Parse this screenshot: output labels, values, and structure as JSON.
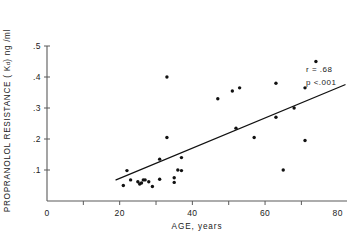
{
  "chart_data": {
    "type": "scatter",
    "title": "",
    "xlabel": "AGE, years",
    "ylabel_prefix": "PROPRANOLOL  RESISTANCE ( K",
    "ylabel_sub": "d",
    "ylabel_suffix": " ) ng /ml",
    "ylabel_full": "PROPRANOLOL  RESISTANCE ( Kd ) ng /ml",
    "xlim": [
      0,
      82
    ],
    "ylim": [
      0,
      0.5
    ],
    "xticks": [
      0,
      20,
      40,
      60,
      80
    ],
    "xtick_labels": [
      "0",
      "20",
      "40",
      "60",
      "80"
    ],
    "xminor_ticks": [
      10,
      20,
      30,
      40,
      50,
      60,
      70
    ],
    "yticks": [
      0.1,
      0.2,
      0.3,
      0.4,
      0.5
    ],
    "ytick_labels": [
      ".1",
      ".2",
      ".3",
      ".4",
      ".5"
    ],
    "y_origin_label": "0",
    "grid": false,
    "legend": null,
    "marker": "filled-circle",
    "marker_color": "#111111",
    "marker_size_px": 3.4,
    "x": [
      21,
      22,
      23,
      25,
      25.5,
      26,
      26.5,
      27,
      28,
      29,
      31,
      31,
      33,
      33,
      35,
      35,
      36,
      37,
      37,
      47,
      51,
      52,
      53,
      57,
      63,
      63,
      65,
      68,
      71,
      71,
      74
    ],
    "y": [
      0.05,
      0.098,
      0.068,
      0.062,
      0.055,
      0.058,
      0.068,
      0.068,
      0.062,
      0.047,
      0.07,
      0.135,
      0.205,
      0.4,
      0.06,
      0.075,
      0.1,
      0.14,
      0.098,
      0.33,
      0.355,
      0.235,
      0.365,
      0.205,
      0.27,
      0.38,
      0.1,
      0.3,
      0.195,
      0.365,
      0.45
    ],
    "regression_line": {
      "x0": 19,
      "y0": 0.068,
      "x1": 82,
      "y1": 0.375,
      "color": "#111111",
      "width_px": 1.3
    },
    "annotations": [
      {
        "name": "correlation",
        "text": "r = .68"
      },
      {
        "name": "p-value",
        "text": "p <.001"
      }
    ]
  }
}
